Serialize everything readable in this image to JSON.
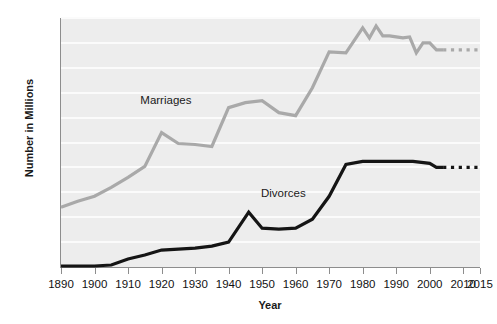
{
  "chart_data": {
    "type": "line",
    "title": "",
    "xlabel": "Year",
    "ylabel": "Number in Millions",
    "xlim": [
      1890,
      2015
    ],
    "ylim": [
      0.0,
      2.5
    ],
    "grid": true,
    "legend_position": "inline-annotation",
    "x_tick_labels": [
      "1890",
      "1900",
      "1910",
      "1920",
      "1930",
      "1940",
      "1950",
      "1960",
      "1970",
      "1980",
      "1990",
      "2000",
      "2010",
      "2015"
    ],
    "x_tick_values": [
      1890,
      1900,
      1910,
      1920,
      1930,
      1940,
      1950,
      1960,
      1970,
      1980,
      1990,
      2000,
      2010,
      2015
    ],
    "y_tick_labels": [
      ".00",
      ".25",
      ".50",
      ".75",
      "1.0",
      "1.25",
      "1.50",
      "1.75",
      "2.0",
      "2.25",
      "2.50"
    ],
    "y_tick_values": [
      0.0,
      0.25,
      0.5,
      0.75,
      1.0,
      1.25,
      1.5,
      1.75,
      2.0,
      2.25,
      2.5
    ],
    "series": [
      {
        "name": "Marriages",
        "color": "#a9a9a9",
        "label_x": 1925,
        "label_y": 1.67,
        "solid": {
          "x": [
            1890,
            1895,
            1900,
            1905,
            1910,
            1915,
            1920,
            1925,
            1930,
            1935,
            1940,
            1945,
            1950,
            1955,
            1960,
            1965,
            1970,
            1975,
            1980,
            1982,
            1984,
            1986,
            1988,
            1990,
            1992,
            1994,
            1996,
            1998,
            2000,
            2002,
            2004
          ],
          "y": [
            0.6,
            0.66,
            0.71,
            0.8,
            0.9,
            1.01,
            1.35,
            1.24,
            1.23,
            1.21,
            1.6,
            1.65,
            1.67,
            1.55,
            1.52,
            1.8,
            2.16,
            2.15,
            2.4,
            2.3,
            2.42,
            2.32,
            2.32,
            2.31,
            2.3,
            2.31,
            2.15,
            2.25,
            2.25,
            2.18,
            2.18
          ]
        },
        "dashed": {
          "x": [
            2004,
            2015
          ],
          "y": [
            2.18,
            2.18
          ]
        }
      },
      {
        "name": "Divorces",
        "color": "#151515",
        "label_x": 1958,
        "label_y": 0.73,
        "solid": {
          "x": [
            1890,
            1895,
            1900,
            1905,
            1910,
            1915,
            1920,
            1925,
            1930,
            1935,
            1940,
            1946,
            1950,
            1955,
            1960,
            1965,
            1970,
            1975,
            1980,
            1985,
            1990,
            1995,
            2000,
            2002,
            2004
          ],
          "y": [
            0.01,
            0.01,
            0.01,
            0.02,
            0.08,
            0.12,
            0.17,
            0.18,
            0.19,
            0.21,
            0.25,
            0.55,
            0.39,
            0.38,
            0.39,
            0.48,
            0.71,
            1.03,
            1.06,
            1.06,
            1.06,
            1.06,
            1.04,
            1.0,
            1.0
          ]
        },
        "dashed": {
          "x": [
            2004,
            2015
          ],
          "y": [
            1.0,
            1.0
          ]
        }
      }
    ],
    "colors": {
      "plot_background": "#ededed",
      "gridline": "#fbfbfb",
      "axis": "#8d8d8d",
      "text": "#121212",
      "marriages_line": "#a9a9a9",
      "divorces_line": "#151515"
    }
  }
}
